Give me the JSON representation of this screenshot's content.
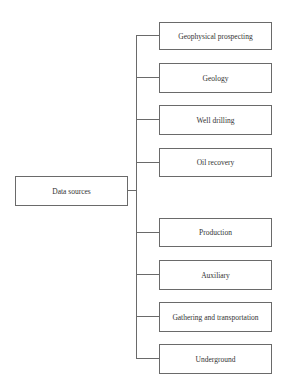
{
  "diagram": {
    "type": "tree",
    "root": {
      "label": "Data sources"
    },
    "children": [
      {
        "label": "Geophysical prospecting"
      },
      {
        "label": "Geology"
      },
      {
        "label": "Well drilling"
      },
      {
        "label": "Oil recovery"
      },
      {
        "label": "Production"
      },
      {
        "label": "Auxiliary"
      },
      {
        "label": "Gathering and transportation"
      },
      {
        "label": "Underground"
      }
    ],
    "colors": {
      "line": "#6a6a6a",
      "text": "#333333",
      "background": "#ffffff"
    }
  }
}
